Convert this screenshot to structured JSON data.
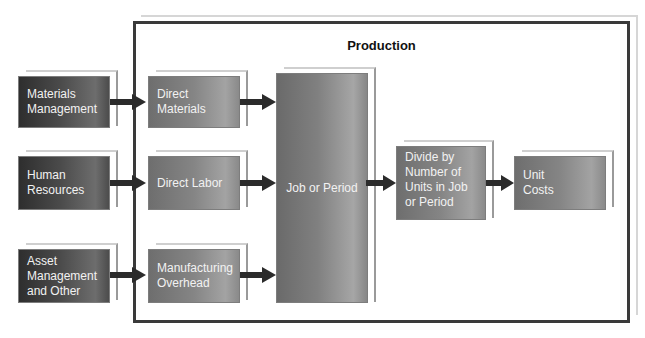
{
  "diagram": {
    "title": "Production",
    "sources": [
      {
        "label": "Materials Management",
        "lines": [
          "Materials",
          "Management"
        ]
      },
      {
        "label": "Human Resources",
        "lines": [
          "Human",
          "Resources"
        ]
      },
      {
        "label": "Asset Management and Other",
        "lines": [
          "Asset",
          "Management",
          "and Other"
        ]
      }
    ],
    "cost_elements": [
      {
        "label": "Direct Materials",
        "lines": [
          "Direct",
          "Materials"
        ]
      },
      {
        "label": "Direct Labor",
        "lines": [
          "Direct Labor"
        ]
      },
      {
        "label": "Manufacturing Overhead",
        "lines": [
          "Manufacturing",
          "Overhead"
        ]
      }
    ],
    "job_or_period": {
      "label": "Job or Period"
    },
    "divide": {
      "label": "Divide by Number of Units in Job or Period",
      "lines": [
        "Divide by",
        "Number of",
        "Units in Job",
        "or Period"
      ]
    },
    "unit_costs": {
      "label": "Unit Costs",
      "lines": [
        "Unit",
        "Costs"
      ]
    },
    "colors": {
      "frame_border": "#3a3a3a",
      "arrow": "#2b2b2b",
      "dark_box": "#3c3c3c",
      "mid_box": "#878787",
      "text": "#f2f2f2"
    }
  }
}
